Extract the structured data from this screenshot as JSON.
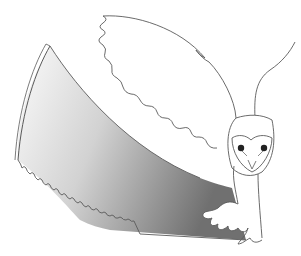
{
  "illustration": {
    "subject": "barn owl with saw-blade wing",
    "colors": {
      "background": "#ffffff",
      "outline": "#5a5a5a",
      "blade_light": "#f4f4f4",
      "blade_dark": "#6e6e6e",
      "eye": "#222222"
    }
  }
}
